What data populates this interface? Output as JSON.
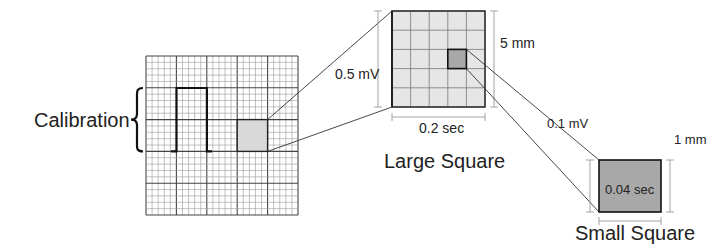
{
  "diagram": {
    "calibration_label": "Calibration",
    "large_square": {
      "title": "Large Square",
      "voltage_label": "0.5 mV",
      "height_label": "5 mm",
      "time_label": "0.2 sec",
      "fill": "#e6e6e6"
    },
    "small_square": {
      "title": "Small Square",
      "voltage_label": "0.1 mV",
      "height_label": "1 mm",
      "time_label": "0.04 sec",
      "fill": "#a8a8a8"
    },
    "ecg_grid": {
      "major_columns": 5,
      "major_rows": 5,
      "minor_per_major": 5,
      "highlight_fill": "#d9d9d9"
    }
  }
}
